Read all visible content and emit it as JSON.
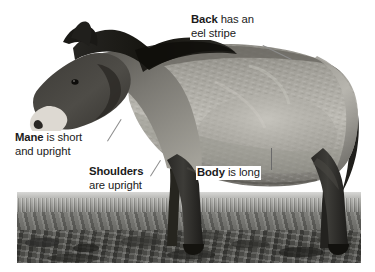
{
  "page": {
    "background_color": "#ffffff",
    "figure_type": "annotated-photograph",
    "photo_style": "black-and-white photograph"
  },
  "annotations": [
    {
      "id": "back",
      "term": "Back",
      "text_line1": " has an",
      "text_line2": "eel stripe",
      "full_text": "Back has an eel stripe",
      "leader": "diagonal line pointing down-right to the horse's back"
    },
    {
      "id": "mane",
      "term": "Mane",
      "text_line1": " is short",
      "text_line2": "and upright",
      "full_text": "Mane is short and upright",
      "leader": "diagonal line pointing up-right to the mane along the neck"
    },
    {
      "id": "shoulders",
      "term": "Shoulders",
      "text_line1": "",
      "text_line2": "are upright",
      "full_text": "Shoulders are upright",
      "leader": "short diagonal line pointing up-right to the shoulder"
    },
    {
      "id": "body",
      "term": "Body",
      "text_line1": " is long",
      "text_line2": "",
      "full_text": "Body is long",
      "leader": "short vertical line pointing up to the barrel of the body"
    }
  ],
  "colors": {
    "text": "#1b1b1b",
    "leader_line": "#8c8c8c",
    "plate": "#ffffff",
    "coat_light": "#b8b6b0",
    "coat_mid": "#8d8b85",
    "coat_dark": "#3a3936",
    "mane_dark": "#232220",
    "muzzle_light": "#e3e1dc",
    "ground_dark": "#464642"
  }
}
